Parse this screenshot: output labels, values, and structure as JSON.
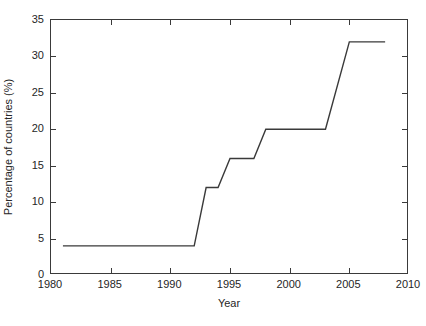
{
  "chart_data": {
    "type": "line",
    "title": "",
    "xlabel": "Year",
    "ylabel": "Percentage of countries (%)",
    "xlim": [
      1980,
      2010
    ],
    "ylim": [
      0,
      35
    ],
    "xticks": [
      1980,
      1985,
      1990,
      1995,
      2000,
      2005,
      2010
    ],
    "xticklabels": [
      "1980",
      "1985",
      "1990",
      "1995",
      "2000",
      "2005",
      "2010"
    ],
    "yticks": [
      0,
      5,
      10,
      15,
      20,
      25,
      30,
      35
    ],
    "yticklabels": [
      "0",
      "5",
      "10",
      "15",
      "20",
      "25",
      "30",
      "35"
    ],
    "grid": false,
    "legend": null,
    "series": [
      {
        "name": "Percentage of countries",
        "color": "#3a3a3a",
        "linewidth": 1.4,
        "x": [
          1981,
          1992,
          1993,
          1994,
          1995,
          1997,
          1998,
          2003,
          2005,
          2008
        ],
        "y": [
          4,
          4,
          12,
          12,
          16,
          16,
          20,
          20,
          32,
          32
        ]
      }
    ]
  }
}
